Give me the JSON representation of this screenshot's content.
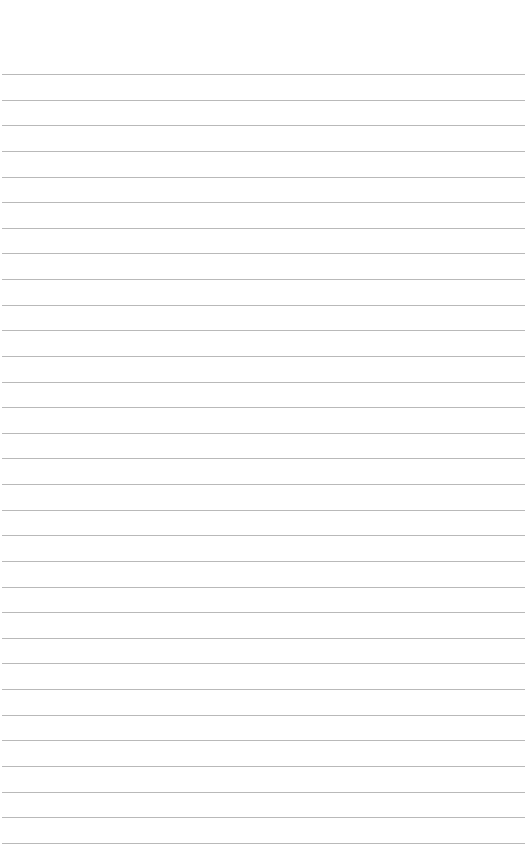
{
  "page": {
    "type": "lined-paper",
    "background": "#ffffff",
    "rule_color": "#b9b9b9",
    "rule_count": 31,
    "first_rule_y": 74,
    "rule_spacing": 25.63,
    "rule_left": 2,
    "rule_width": 523
  }
}
